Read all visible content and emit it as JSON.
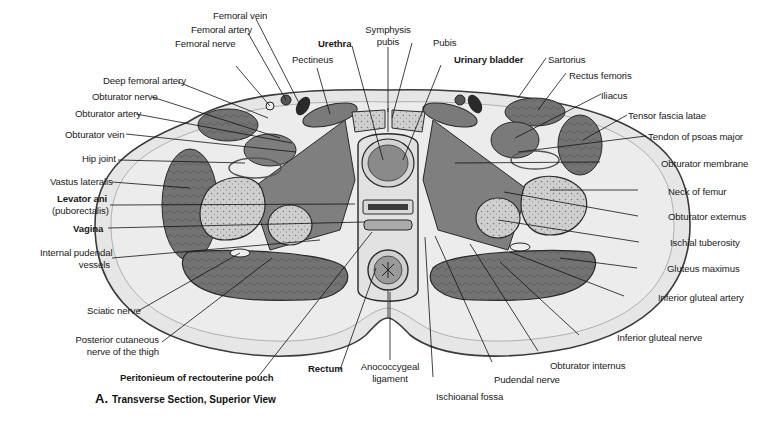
{
  "figure": {
    "caption_letter": "A.",
    "caption_text": "Transverse Section, Superior View"
  },
  "labels": {
    "femoral_vein": "Femoral vein",
    "femoral_artery": "Femoral artery",
    "femoral_nerve": "Femoral nerve",
    "deep_femoral_artery": "Deep femoral artery",
    "obturator_nerve": "Obturator nerve",
    "obturator_artery": "Obturator artery",
    "obturator_vein": "Obturator vein",
    "hip_joint": "Hip joint",
    "vastus_lateralis": "Vastus lateralis",
    "levator_ani": "Levator ani",
    "levator_ani_sub": "(puborectalis)",
    "vagina": "Vagina",
    "internal_pudendal_1": "Internal pudendal",
    "internal_pudendal_2": "vessels",
    "sciatic_nerve": "Sciatic nerve",
    "posterior_cutaneous_1": "Posterior cutaneous",
    "posterior_cutaneous_2": "nerve of the thigh",
    "peritoneum": "Peritonieum of rectouterine pouch",
    "rectum": "Rectum",
    "anococcygeal_1": "Anococcygeal",
    "anococcygeal_2": "ligament",
    "ischioanal_fossa": "Ischioanal fossa",
    "pudendal_nerve": "Pudendal nerve",
    "obturator_internus": "Obturator internus",
    "inferior_gluteal_nerve": "Inferior gluteal nerve",
    "inferior_gluteal_artery": "Inferior gluteal artery",
    "gluteus_maximus": "Gluteus maximus",
    "ischial_tuberosity": "Ischial tuberosity",
    "obturator_externus": "Obturator externus",
    "neck_of_femur": "Neck of femur",
    "obturator_membrane": "Obturator membrane",
    "tendon_psoas": "Tendon of psoas major",
    "tensor_fascia": "Tensor fascia latae",
    "iliacus": "Iliacus",
    "rectus_femoris": "Rectus femoris",
    "sartorius": "Sartorius",
    "urinary_bladder": "Urinary bladder",
    "pubis": "Pubis",
    "symphysis_1": "Symphysis",
    "symphysis_2": "pubis",
    "urethra": "Urethra",
    "pectineus": "Pectineus"
  },
  "colors": {
    "fat": "#e4e4e4",
    "skin_edge": "#9a9a9a",
    "muscle": "#6e6e6e",
    "muscle_light": "#8a8a8a",
    "bone": "#c8c8c8",
    "outline": "#2a2a2a",
    "leader": "#111111"
  }
}
